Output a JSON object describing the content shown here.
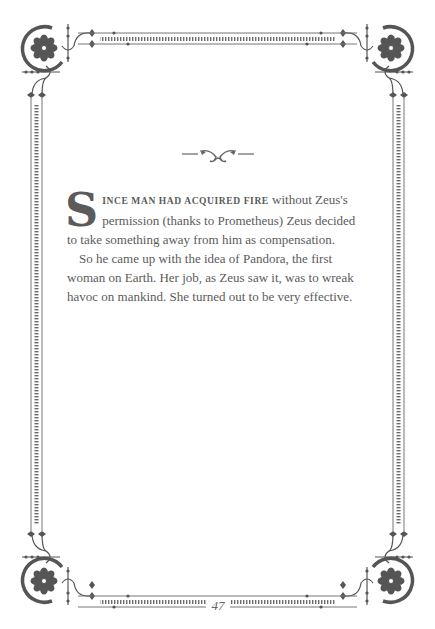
{
  "page": {
    "dropcap": "S",
    "lead_smallcaps": "ince man had acquired fire",
    "paragraphs": [
      " without Zeus's permission (thanks to Prometheus) Zeus decided to take something away from him as compensation.",
      "So he came up with the idea of Pandora, the first woman on Earth. Her job, as Zeus saw it, was to wreak havoc on mankind. She turned out to be very effective."
    ],
    "page_number": "47"
  },
  "decoration": {
    "border_color": "#5a5a5a",
    "corner_icon": "floral-medallion-icon",
    "section_icon": "fleuron-divider-icon"
  }
}
